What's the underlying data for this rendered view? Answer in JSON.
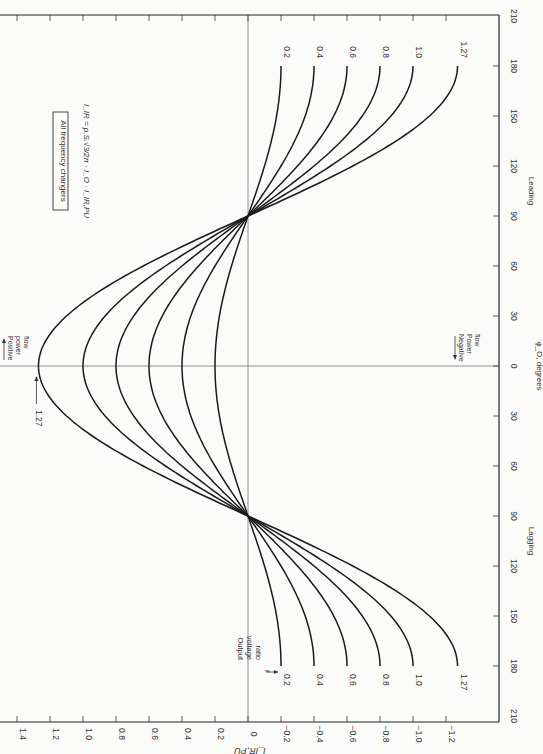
{
  "chart_data": {
    "type": "line",
    "orientation": "rotated-90",
    "title": "All frequency changers",
    "formula": "I_IR = p.S.(√3/2π).I_O.I_IR,PU",
    "xlabel": "φ_O, degrees",
    "ylabel": "I_IR,PU",
    "x_ticks": [
      "210",
      "180",
      "150",
      "120",
      "90",
      "60",
      "30",
      "0",
      "30",
      "60",
      "90",
      "120",
      "150",
      "180",
      "210"
    ],
    "x_region_labels": {
      "leading": "Leading",
      "lagging": "Lagging"
    },
    "y_ticks": [
      1.4,
      1.2,
      1.0,
      0.8,
      0.6,
      0.4,
      0.2,
      0,
      -0.2,
      -0.4,
      -0.6,
      -0.8,
      -1.0,
      -1.2
    ],
    "y_tick_labels": [
      "1.4",
      "1.2",
      "1.0",
      "0.8",
      "0.6",
      "0.4",
      "0.2",
      "0",
      "−0.2",
      "−0.4",
      "−0.6",
      "−0.8",
      "−1.0",
      "−1.2"
    ],
    "xlim": [
      -180,
      180
    ],
    "ylim": [
      -1.3,
      1.4
    ],
    "grid": false,
    "legend_title": "Output voltage ratio r",
    "x": [
      -180,
      -150,
      -120,
      -90,
      -60,
      -30,
      0,
      30,
      60,
      90,
      120,
      150,
      180
    ],
    "series": [
      {
        "name": "0.2",
        "values": [
          -0.2,
          -0.173,
          -0.1,
          0,
          0.1,
          0.173,
          0.2,
          0.173,
          0.1,
          0,
          -0.1,
          -0.173,
          -0.2
        ]
      },
      {
        "name": "0.4",
        "values": [
          -0.4,
          -0.346,
          -0.2,
          0,
          0.2,
          0.346,
          0.4,
          0.346,
          0.2,
          0,
          -0.2,
          -0.346,
          -0.4
        ]
      },
      {
        "name": "0.6",
        "values": [
          -0.6,
          -0.52,
          -0.3,
          0,
          0.3,
          0.52,
          0.6,
          0.52,
          0.3,
          0,
          -0.3,
          -0.52,
          -0.6
        ]
      },
      {
        "name": "0.8",
        "values": [
          -0.8,
          -0.693,
          -0.4,
          0,
          0.4,
          0.693,
          0.8,
          0.693,
          0.4,
          0,
          -0.4,
          -0.693,
          -0.8
        ]
      },
      {
        "name": "1.0",
        "values": [
          -1.0,
          -0.866,
          -0.5,
          0,
          0.5,
          0.866,
          1.0,
          0.866,
          0.5,
          0,
          -0.5,
          -0.866,
          -1.0
        ]
      },
      {
        "name": "1.27",
        "values": [
          -1.27,
          -1.1,
          -0.635,
          0,
          0.635,
          1.1,
          1.27,
          1.1,
          0.635,
          0,
          -0.635,
          -1.1,
          -1.27
        ]
      }
    ],
    "annotations": [
      {
        "text": "Positive power flow",
        "position": "near peak, positive I side"
      },
      {
        "text": "Negative power flow",
        "position": "negative I side at φ=0"
      },
      {
        "text": "1.27",
        "position": "arrow pointing to peak of 1.27 curve"
      },
      {
        "text": "Output voltage ratio r",
        "position": "arrow to curve labels at lagging 180"
      }
    ]
  },
  "labels": {
    "box": "All frequency changers",
    "formula": "I_IR = p.S.√3/2π · I_O · I_IR,PU",
    "positive": [
      "Positive",
      "power",
      "flow"
    ],
    "negative": [
      "Negative",
      "Power",
      "flow"
    ],
    "peak_label": "1.27",
    "ovr": [
      "Output",
      "voltage",
      "ratio",
      "r"
    ],
    "xlabel": "φ_O, degrees",
    "ylabel": "I_IR,PU",
    "leading": "Leading",
    "lagging": "Lagging"
  }
}
